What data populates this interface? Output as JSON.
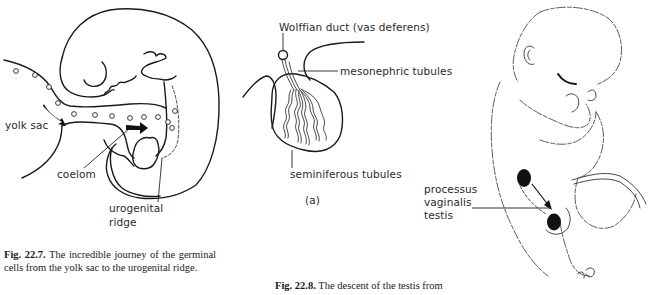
{
  "figures": [
    {
      "id": "fig-22-7",
      "labels": {
        "yolk_sac": "yolk sac",
        "coelom": "coelom",
        "urogenital_ridge_line1": "urogenital",
        "urogenital_ridge_line2": "ridge"
      },
      "caption": {
        "number": "Fig. 22.7.",
        "text": "The incredible journey of the germinal cells from the yolk sac to the urogenital ridge."
      }
    },
    {
      "id": "fig-22-8a",
      "labels": {
        "wolffian_duct": "Wolffian duct (vas deferens)",
        "mesonephric_tubules": "mesonephric tubules",
        "seminiferous_tubules": "seminiferous tubules",
        "panel": "(a)"
      },
      "caption": {
        "number": "Fig. 22.8.",
        "text": "The descent of the testis from"
      }
    },
    {
      "id": "fig-22-8b",
      "labels": {
        "processus": "processus",
        "vaginalis": "vaginalis",
        "testis": "testis"
      }
    }
  ]
}
